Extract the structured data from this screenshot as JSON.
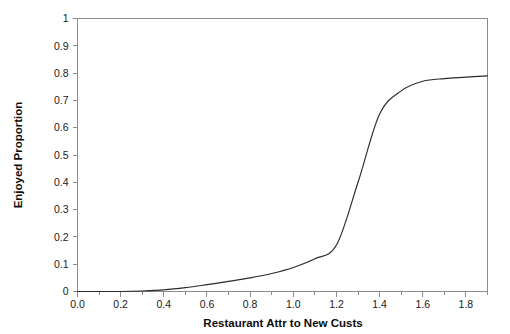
{
  "chart_data": {
    "type": "line",
    "title": "",
    "xlabel": "Restaurant Attr to New Custs",
    "ylabel": "Enjoyed Proportion",
    "xlim": [
      0.0,
      1.9
    ],
    "ylim": [
      0,
      1
    ],
    "grid": false,
    "legend": "none",
    "line_color": "#2b2b2b",
    "frame_color": "#8c8c8c",
    "background_color": "#ffffff",
    "xticks": [
      0.0,
      0.2,
      0.4,
      0.6,
      0.8,
      1.0,
      1.2,
      1.4,
      1.6,
      1.8
    ],
    "xtick_labels": [
      "0.0",
      "0.2",
      "0.4",
      "0.6",
      "0.8",
      "1.0",
      "1.2",
      "1.4",
      "1.6",
      "1.8"
    ],
    "xtick_minor": [
      0.1,
      0.3,
      0.5,
      0.7,
      0.9,
      1.1,
      1.3,
      1.5,
      1.7,
      1.9
    ],
    "yticks": [
      0,
      0.1,
      0.2,
      0.3,
      0.4,
      0.5,
      0.6,
      0.7,
      0.8,
      0.9,
      1
    ],
    "ytick_labels": [
      "0",
      "0.1",
      "0.2",
      "0.3",
      "0.4",
      "0.5",
      "0.6",
      "0.7",
      "0.8",
      "0.9",
      "1"
    ],
    "series": [
      {
        "name": "Enjoyed Proportion",
        "x": [
          0.0,
          0.1,
          0.2,
          0.3,
          0.4,
          0.5,
          0.6,
          0.7,
          0.8,
          0.9,
          1.0,
          1.1,
          1.2,
          1.3,
          1.4,
          1.5,
          1.6,
          1.7,
          1.8,
          1.9
        ],
        "values": [
          0.0,
          0.0,
          0.0,
          0.002,
          0.006,
          0.014,
          0.025,
          0.037,
          0.05,
          0.066,
          0.088,
          0.12,
          0.17,
          0.4,
          0.65,
          0.735,
          0.77,
          0.78,
          0.785,
          0.79
        ]
      }
    ]
  },
  "axes": {
    "x_title": "Restaurant Attr to New Custs",
    "y_title": "Enjoyed Proportion"
  }
}
